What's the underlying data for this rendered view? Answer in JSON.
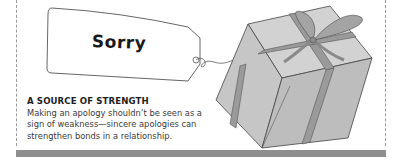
{
  "tag": {
    "label": "Sorry"
  },
  "callout": {
    "heading": "A SOURCE OF STRENGTH",
    "body": "Making an apology shouldn’t be seen as a sign of weakness—sincere apologies can strengthen bonds in a relationship."
  },
  "illustration": {
    "subject": "gift-box-with-ribbon-and-tag"
  },
  "colors": {
    "bar": "#8e8e8e",
    "box_fill": "#c9c9c9",
    "ribbon": "#9a9a9a",
    "text": "#3a3a3a"
  }
}
